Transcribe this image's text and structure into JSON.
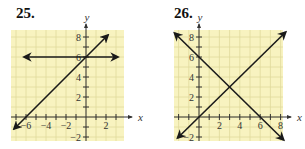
{
  "chart_data": [
    {
      "type": "line",
      "title": "25.",
      "xlabel": "x",
      "ylabel": "y",
      "xlim": [
        -7.5,
        3.8
      ],
      "ylim": [
        -2.4,
        8.7
      ],
      "x_ticks": [
        -6,
        -4,
        -2,
        2
      ],
      "y_ticks": [
        -2,
        2,
        4,
        6,
        8
      ],
      "grid": true,
      "series": [
        {
          "name": "horizontal line y = 6",
          "points": [
            [
              -6.2,
              6
            ],
            [
              3.2,
              6
            ]
          ],
          "arrows": "both"
        },
        {
          "name": "line y = x + 6",
          "points": [
            [
              -7.2,
              -1.2
            ],
            [
              2.2,
              8.2
            ]
          ],
          "arrows": "both"
        }
      ]
    },
    {
      "type": "line",
      "title": "26.",
      "xlabel": "x",
      "ylabel": "y",
      "xlim": [
        -2.5,
        8.4
      ],
      "ylim": [
        -2.4,
        8.7
      ],
      "x_ticks": [
        2,
        4,
        6,
        8
      ],
      "y_ticks": [
        -2,
        2,
        4,
        6,
        8
      ],
      "grid": true,
      "series": [
        {
          "name": "line y = -x + 6",
          "points": [
            [
              -2.4,
              8.4
            ],
            [
              8.3,
              -2.3
            ]
          ],
          "arrows": "both"
        },
        {
          "name": "line y = x",
          "points": [
            [
              -2.1,
              -2.1
            ],
            [
              8.5,
              8.5
            ]
          ],
          "arrows": "both"
        }
      ]
    }
  ],
  "labels": {
    "p25": "25.",
    "p26": "26.",
    "x": "x",
    "y": "y"
  },
  "colors": {
    "grid_bg": "#f8f3c0",
    "grid_line": "#e0d99c",
    "line": "#1a1a1a"
  }
}
